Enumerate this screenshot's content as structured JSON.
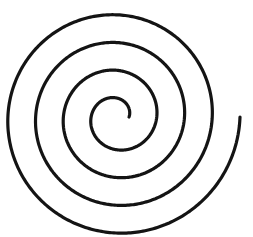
{
  "image": {
    "title": "Archimedean Spiral",
    "kind": "line-drawing",
    "width": 253,
    "height": 237,
    "background_color": "#ffffff"
  },
  "spiral": {
    "name": "archimedean-spiral",
    "stroke_color": "#141414",
    "stroke_width": 3.2,
    "line_cap": "round",
    "center_x": 117,
    "center_y": 117,
    "turns": 4.0,
    "turn_spacing_px": 30,
    "direction": "counterclockwise-outward",
    "inner_radius": 12,
    "outer_radius": 123,
    "start_angle_deg": 0,
    "inner_terminus_x": 129,
    "inner_terminus_y": 117,
    "outer_terminus_x": 240,
    "outer_terminus_y": 115,
    "bounds_left_x": 14,
    "bounds_right_x": 240,
    "bounds_top_y": 13,
    "bounds_bottom_y": 222,
    "left_crossings_x": [
      14,
      44,
      74,
      100
    ],
    "right_crossings_x": [
      160,
      190,
      220,
      240
    ],
    "top_crossings_y": [
      13,
      47,
      78,
      103
    ],
    "bottom_crossings_y": [
      130,
      163,
      192,
      222
    ]
  }
}
